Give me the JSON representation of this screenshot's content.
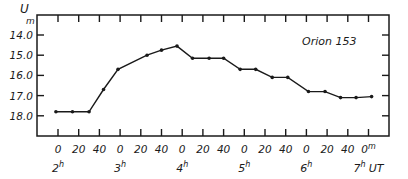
{
  "chart_data": {
    "type": "line",
    "title": "Orion 153",
    "annotation": "Orion 153",
    "xlabel": "UT",
    "ylabel": "U_m",
    "y_unit_label": "U",
    "y_unit_sub": "m",
    "y_inverted": true,
    "ylim": [
      13.0,
      19.0
    ],
    "y_ticks": [
      "14.0",
      "15.0",
      "16.0",
      "17.0",
      "18.0"
    ],
    "y_tick_values": [
      14.0,
      15.0,
      16.0,
      17.0,
      18.0
    ],
    "x_unit": "minutes since 2h UT",
    "x_ticks_minor": [
      "0",
      "20",
      "40",
      "0",
      "20",
      "40",
      "0",
      "20",
      "40",
      "0",
      "20",
      "40",
      "0",
      "20",
      "40",
      "0"
    ],
    "x_ticks_minor_last_suffix": "m",
    "x_ticks_major": [
      {
        "label": "2",
        "sup": "h",
        "minute": 0
      },
      {
        "label": "3",
        "sup": "h",
        "minute": 60
      },
      {
        "label": "4",
        "sup": "h",
        "minute": 120
      },
      {
        "label": "5",
        "sup": "h",
        "minute": 180
      },
      {
        "label": "6",
        "sup": "h",
        "minute": 240
      },
      {
        "label": "7",
        "sup": "h",
        "minute": 300
      }
    ],
    "x_axis_suffix": "UT",
    "grid": false,
    "series": [
      {
        "name": "Orion 153",
        "x": [
          -2,
          14,
          30,
          44,
          58,
          86,
          100,
          115,
          130,
          146,
          160,
          176,
          191,
          207,
          222,
          242,
          258,
          273,
          288,
          303
        ],
        "values": [
          17.8,
          17.8,
          17.8,
          16.7,
          15.7,
          15.0,
          14.75,
          14.55,
          15.15,
          15.15,
          15.15,
          15.7,
          15.7,
          16.1,
          16.1,
          16.8,
          16.8,
          17.1,
          17.1,
          17.05
        ]
      }
    ]
  }
}
